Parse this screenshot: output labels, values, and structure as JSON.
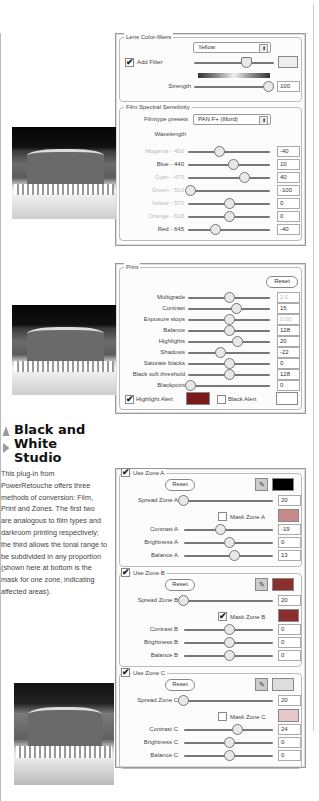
{
  "article": {
    "heading": "Black and White Studio",
    "heading_lines": [
      "Black and",
      "White",
      "Studio"
    ],
    "body": "This plug-in from PowerRetouche offers three methods of conversion: Film, Print and Zones. The first two are analogous to film types and darkroom printing respectively; the third allows the tonal range to be subdivided in any proportion (shown here at bottom is the mask for one zone, indicating affected areas)."
  },
  "film_panel": {
    "lens_group_title": "Lens Color-filters",
    "filter_select": "Yellow",
    "add_filter_label": "Add Filter",
    "add_filter_checked": true,
    "strength_label": "Strength",
    "strength_value": "100",
    "spectral_group_title": "Film Spectral Sensitivity",
    "filmtype_label": "Filmtype presets",
    "filmtype_value": "PAN F+ (Ilford)",
    "wavelength_label": "Wavelength",
    "sliders": [
      {
        "label": "Magenta - 400",
        "value": "-40",
        "pos": 0.38,
        "dim": true
      },
      {
        "label": "Blue - 440",
        "value": "10",
        "pos": 0.55,
        "dim": false
      },
      {
        "label": "Cyan - 470",
        "value": "40",
        "pos": 0.68,
        "dim": true
      },
      {
        "label": "Green - 510",
        "value": "-100",
        "pos": 0.03,
        "dim": true
      },
      {
        "label": "Yellow - 570",
        "value": "0",
        "pos": 0.5,
        "dim": true
      },
      {
        "label": "Orange - 618",
        "value": "0",
        "pos": 0.5,
        "dim": true
      },
      {
        "label": "Red - 645",
        "value": "-40",
        "pos": 0.33,
        "dim": false
      }
    ]
  },
  "print_panel": {
    "group_title": "Print",
    "reset_label": "Reset",
    "sliders": [
      {
        "label": "Multigrade",
        "value": "2.0",
        "pos": 0.5,
        "dim_value": true
      },
      {
        "label": "Contrast",
        "value": "15",
        "pos": 0.58,
        "dim_value": false
      },
      {
        "label": "Exposure stops",
        "value": "0.00",
        "pos": 0.5,
        "dim_value": true
      },
      {
        "label": "Balance",
        "value": "128",
        "pos": 0.5,
        "dim_value": false
      },
      {
        "label": "Highlights",
        "value": "20",
        "pos": 0.6,
        "dim_value": false
      },
      {
        "label": "Shadows",
        "value": "-22",
        "pos": 0.39,
        "dim_value": false
      },
      {
        "label": "Saturate blacks",
        "value": "0",
        "pos": 0.5,
        "dim_value": false
      },
      {
        "label": "Black soft threshold",
        "value": "128",
        "pos": 0.5,
        "dim_value": false
      },
      {
        "label": "Blackpoint",
        "value": "0",
        "pos": 0.03,
        "dim_value": false
      }
    ],
    "highlight_alert_label": "Highlight Alert",
    "highlight_alert_checked": true,
    "highlight_alert_color": "#7a1a1a",
    "black_alert_label": "Black Alert",
    "black_alert_checked": false
  },
  "zones_panel": {
    "zones": [
      {
        "title": "Use Zone A",
        "checked": true,
        "reset_label": "Reset",
        "swatch_color": "#000000",
        "spread_label": "Spread Zone A",
        "spread_value": "20",
        "spread_pos": 0.03,
        "mask_label": "Mask Zone A",
        "mask_checked": false,
        "mask_color": "#c88a8a",
        "rows": [
          {
            "label": "Contrast A",
            "value": "-19",
            "pos": 0.4
          },
          {
            "label": "Brightness A",
            "value": "0",
            "pos": 0.5
          },
          {
            "label": "Balance A",
            "value": "13",
            "pos": 0.56
          }
        ]
      },
      {
        "title": "Use Zone B",
        "checked": true,
        "reset_label": "Reset",
        "swatch_color": "#8a2e2e",
        "spread_label": "Spread Zone B",
        "spread_value": "20",
        "spread_pos": 0.03,
        "mask_label": "Mask Zone B",
        "mask_checked": true,
        "mask_color": "#8a2e2e",
        "rows": [
          {
            "label": "Contrast B",
            "value": "0",
            "pos": 0.5
          },
          {
            "label": "Brightness B",
            "value": "0",
            "pos": 0.5
          },
          {
            "label": "Balance B",
            "value": "0",
            "pos": 0.5
          }
        ]
      },
      {
        "title": "Use Zone C",
        "checked": true,
        "reset_label": "Reset",
        "swatch_color": "#dddddd",
        "spread_label": "Spread Zone C",
        "spread_value": "20",
        "spread_pos": 0.03,
        "mask_label": "Mask Zone C",
        "mask_checked": false,
        "mask_color": "#e6c8c8",
        "rows": [
          {
            "label": "Contrast C",
            "value": "24",
            "pos": 0.6
          },
          {
            "label": "Brightness C",
            "value": "0",
            "pos": 0.5
          },
          {
            "label": "Balance C",
            "value": "0",
            "pos": 0.5
          }
        ]
      }
    ]
  },
  "icons": {
    "check": "✔",
    "select_arrows": "⬍",
    "eyedropper": "✎"
  }
}
